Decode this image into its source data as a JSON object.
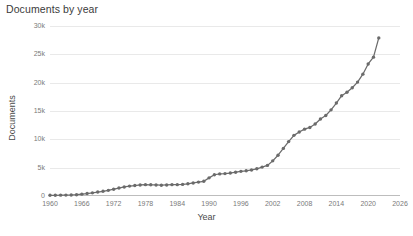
{
  "chart_data": {
    "type": "line",
    "title": "Documents by year",
    "xlabel": "Year",
    "ylabel": "Documents",
    "xlim": [
      1960,
      2026
    ],
    "ylim": [
      0,
      30000
    ],
    "grid": true,
    "legend": null,
    "xticks": [
      "1960",
      "1966",
      "1972",
      "1978",
      "1984",
      "1990",
      "1996",
      "2002",
      "2008",
      "2014",
      "2020",
      "2026"
    ],
    "xtick_values": [
      1960,
      1966,
      1972,
      1978,
      1984,
      1990,
      1996,
      2002,
      2008,
      2014,
      2020,
      2026
    ],
    "yticks": [
      "0",
      "5k",
      "10k",
      "15k",
      "20k",
      "25k",
      "30k"
    ],
    "ytick_values": [
      0,
      5000,
      10000,
      15000,
      20000,
      25000,
      30000
    ],
    "series": [
      {
        "name": "Documents",
        "color": "#6b6b6b",
        "marker": "circle",
        "x": [
          1960,
          1961,
          1962,
          1963,
          1964,
          1965,
          1966,
          1967,
          1968,
          1969,
          1970,
          1971,
          1972,
          1973,
          1974,
          1975,
          1976,
          1977,
          1978,
          1979,
          1980,
          1981,
          1982,
          1983,
          1984,
          1985,
          1986,
          1987,
          1988,
          1989,
          1990,
          1991,
          1992,
          1993,
          1994,
          1995,
          1996,
          1997,
          1998,
          1999,
          2000,
          2001,
          2002,
          2003,
          2004,
          2005,
          2006,
          2007,
          2008,
          2009,
          2010,
          2011,
          2012,
          2013,
          2014,
          2015,
          2016,
          2017,
          2018,
          2019,
          2020,
          2021,
          2022
        ],
        "values": [
          120,
          130,
          150,
          160,
          180,
          230,
          330,
          430,
          560,
          700,
          830,
          1000,
          1200,
          1400,
          1600,
          1750,
          1850,
          1950,
          2000,
          1980,
          1950,
          1900,
          1950,
          2000,
          2000,
          2050,
          2150,
          2300,
          2450,
          2600,
          3200,
          3750,
          3900,
          3950,
          4050,
          4200,
          4350,
          4450,
          4600,
          4800,
          5100,
          5400,
          6200,
          7200,
          8400,
          9600,
          10700,
          11300,
          11800,
          12100,
          12700,
          13600,
          14200,
          15200,
          16400,
          17700,
          18300,
          19100,
          20100,
          21500,
          23300,
          24500,
          27900
        ]
      }
    ]
  },
  "caption": {
    "cut_off_text": ""
  }
}
